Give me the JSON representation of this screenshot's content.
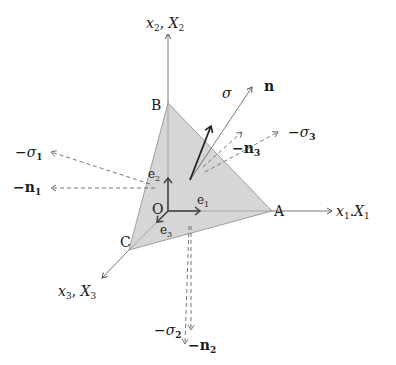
{
  "diagram": {
    "colors": {
      "face_fill": "#d6d6d6",
      "face_stroke": "#8a8a8a",
      "axis": "#555555",
      "dashed": "#666666",
      "sigma": "#222222",
      "text": "#1a1a1a"
    },
    "axes": {
      "x1": {
        "label": "x",
        "sub": "1",
        "label2": "X",
        "sub2": "1"
      },
      "x2": {
        "label": "x",
        "sub": "2",
        "label2": "X",
        "sub2": "2"
      },
      "x3": {
        "label": "x",
        "sub": "3",
        "label2": "X",
        "sub2": "3"
      }
    },
    "points": {
      "O": "O",
      "A": "A",
      "B": "B",
      "C": "C"
    },
    "basis": {
      "e1": {
        "label": "e",
        "sub": "1"
      },
      "e2": {
        "label": "e",
        "sub": "2"
      },
      "e3": {
        "label": "e",
        "sub": "3"
      }
    },
    "vectors": {
      "sigma": {
        "label": "σ"
      },
      "n": {
        "label": "n"
      },
      "neg_sigma1": {
        "label": "−σ",
        "sub": "1"
      },
      "neg_n1": {
        "label": "−n",
        "sub": "1"
      },
      "neg_sigma2": {
        "label": "−σ",
        "sub": "2"
      },
      "neg_n2": {
        "label": "−n",
        "sub": "2"
      },
      "neg_sigma3": {
        "label": "−σ",
        "sub": "3"
      },
      "neg_n3": {
        "label": "−n",
        "sub": "3"
      }
    }
  }
}
